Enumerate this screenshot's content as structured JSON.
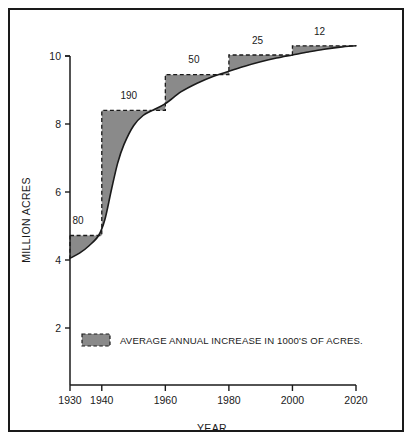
{
  "chart_data": {
    "type": "area",
    "title": "",
    "xlabel": "YEAR",
    "ylabel": "MILLION ACRES",
    "xlim": [
      1930,
      2020
    ],
    "ylim": [
      0,
      10.6
    ],
    "grid": false,
    "y_ticks": [
      2,
      4,
      6,
      8,
      10
    ],
    "y_tick_labels": [
      "2",
      "4",
      "6",
      "8",
      "10"
    ],
    "x_ticks": [
      1930,
      1940,
      1960,
      1980,
      2000,
      2020
    ],
    "x_tick_labels": [
      "1930",
      "1940",
      "1960",
      "1980",
      "2000",
      "2020"
    ],
    "series": [
      {
        "name": "Cumulative acres (smooth curve)",
        "type": "line",
        "x": [
          1930,
          1933,
          1936,
          1939,
          1941,
          1943,
          1945,
          1947,
          1950,
          1953,
          1956,
          1960,
          1965,
          1970,
          1975,
          1980,
          1985,
          1990,
          1995,
          2000,
          2005,
          2010,
          2015,
          2020
        ],
        "values": [
          4.05,
          4.2,
          4.42,
          4.72,
          5.2,
          6.05,
          6.85,
          7.4,
          7.95,
          8.25,
          8.4,
          8.6,
          8.95,
          9.2,
          9.4,
          9.55,
          9.7,
          9.83,
          9.94,
          10.03,
          10.12,
          10.2,
          10.26,
          10.3
        ],
        "color": "#1a1a1a"
      },
      {
        "name": "AVERAGE ANNUAL INCREASE IN 1000'S OF ACRES.",
        "type": "step",
        "step_edges": [
          1930,
          1940,
          1960,
          1980,
          2000,
          2020
        ],
        "step_levels": [
          4.72,
          8.4,
          9.45,
          10.03,
          10.3
        ],
        "step_rate_labels": [
          "80",
          "190",
          "50",
          "25",
          "12"
        ],
        "fill_color": "#8a8a8a",
        "edge_color": "#1a1a1a",
        "edge_style": "dashed"
      }
    ],
    "annotations": [
      {
        "text": "80",
        "x": 1932.5,
        "y": 5.05
      },
      {
        "text": "190",
        "x": 1948.5,
        "y": 8.75
      },
      {
        "text": "50",
        "x": 1969,
        "y": 9.8
      },
      {
        "text": "25",
        "x": 1989,
        "y": 10.35
      },
      {
        "text": "12",
        "x": 2008.5,
        "y": 10.62
      }
    ]
  },
  "legend": {
    "position": "inside-bottom-left",
    "entries": [
      {
        "label": "AVERAGE ANNUAL INCREASE IN 1000'S OF ACRES.",
        "swatch_fill": "#8a8a8a",
        "swatch_edge": "#1a1a1a"
      }
    ]
  },
  "axes": {
    "y_title": "MILLION ACRES",
    "x_title": "YEAR"
  },
  "colors": {
    "ink": "#1a1a1a",
    "fill_gray": "#8a8a8a",
    "background": "#ffffff"
  }
}
